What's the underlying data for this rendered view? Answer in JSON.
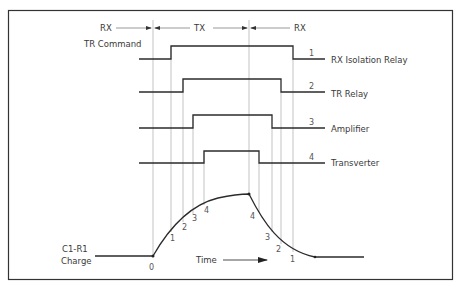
{
  "header": {
    "rx_left": "RX",
    "tx": "TX",
    "rx_right": "RX"
  },
  "labels": {
    "tr_command": "TR Command",
    "charge_line1": "C1-R1",
    "charge_line2": "Charge",
    "time": "Time"
  },
  "signals": [
    {
      "number": "1",
      "name": "RX Isolation Relay"
    },
    {
      "number": "2",
      "name": "TR Relay"
    },
    {
      "number": "3",
      "name": "Amplifier"
    },
    {
      "number": "4",
      "name": "Transverter"
    }
  ],
  "curve_marks": {
    "origin": "0",
    "rise": [
      "1",
      "2",
      "3",
      "4"
    ],
    "fall": [
      "4",
      "3",
      "2",
      "1"
    ]
  },
  "colors": {
    "line": "#2b2b2b",
    "guide": "#9a9a9a",
    "background": "#ffffff"
  }
}
